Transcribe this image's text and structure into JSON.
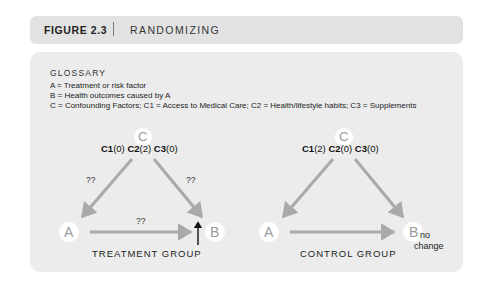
{
  "header": {
    "figure_label": "FIGURE 2.3",
    "title": "RANDOMIZING"
  },
  "glossary": {
    "title": "GLOSSARY",
    "lines": [
      "A = Treatment or risk factor",
      "B = Health outcomes caused by A",
      "C = Confounding Factors;  C1 = Access to Medical Care;  C2 = Health/lifestyle habits;  C3 = Supplements"
    ]
  },
  "diagrams": {
    "treatment": {
      "node_c": "C",
      "node_a": "A",
      "node_b": "B",
      "confounders": [
        {
          "name": "C1",
          "value": "(0)"
        },
        {
          "name": "C2",
          "value": "(2)"
        },
        {
          "name": "C3",
          "value": "(0)"
        }
      ],
      "edge_label_ca": "??",
      "edge_label_cb": "??",
      "edge_label_ab": "??",
      "outcome_indicator": "up-arrow",
      "group_label": "TREATMENT GROUP"
    },
    "control": {
      "node_c": "C",
      "node_a": "A",
      "node_b": "B",
      "confounders": [
        {
          "name": "C1",
          "value": "(2)"
        },
        {
          "name": "C2",
          "value": "(0)"
        },
        {
          "name": "C3",
          "value": "(0)"
        }
      ],
      "outcome_note_1": "no",
      "outcome_note_2": "change",
      "group_label": "CONTROL GROUP"
    }
  },
  "colors": {
    "header_bg": "#e2e2e2",
    "panel_bg": "#ececec",
    "arrow": "#a9a9a9",
    "node_text": "#9a9a9a",
    "node_circle": "#ffffff"
  }
}
